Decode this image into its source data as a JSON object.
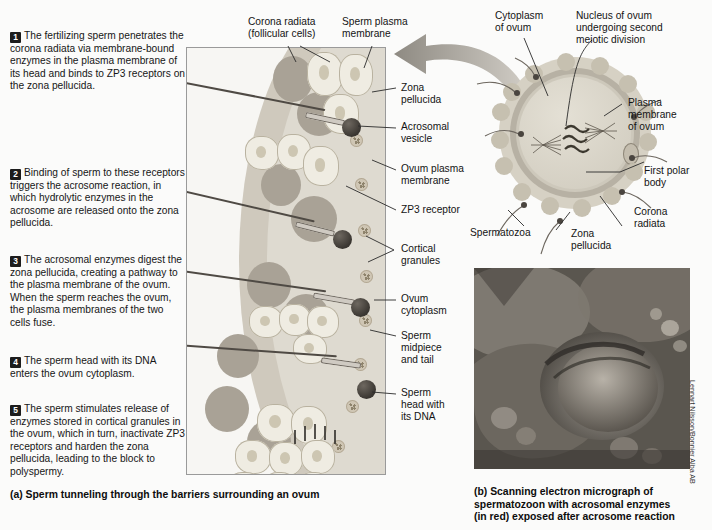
{
  "steps": [
    {
      "num": "1",
      "text": "The fertilizing sperm penetrates the corona radiata via membrane-bound enzymes in the plasma membrane of its head and binds to ZP3 receptors on the zona pellucida."
    },
    {
      "num": "2",
      "text": "Binding of sperm to these receptors triggers the acrosome reaction, in which hydrolytic enzymes in the acrosome are released onto the zona pellucida."
    },
    {
      "num": "3",
      "text": "The acrosomal enzymes digest the zona pellucida, creating a pathway to the plasma membrane of the ovum. When the sperm reaches the ovum, the plasma membranes of the two cells fuse."
    },
    {
      "num": "4",
      "text": "The sperm head with its DNA enters the ovum cytoplasm."
    },
    {
      "num": "5",
      "text": "The sperm stimulates release of enzymes stored in cortical granules in the ovum, which in turn, inactivate ZP3 receptors and harden the zona pellucida, leading to the block to polyspermy."
    }
  ],
  "panel_labels": {
    "corona_radiata": "Corona radiata\n(follicular cells)",
    "sperm_plasma_membrane": "Sperm plasma\nmembrane",
    "zona_pellucida": "Zona\npellucida",
    "acrosomal_vesicle": "Acrosomal\nvesicle",
    "ovum_plasma_membrane": "Ovum plasma\nmembrane",
    "zp3_receptor": "ZP3 receptor",
    "cortical_granules": "Cortical\ngranules",
    "ovum_cytoplasm": "Ovum\ncytoplasm",
    "sperm_midpiece_tail": "Sperm\nmidpiece\nand tail",
    "sperm_head_dna": "Sperm\nhead with\nits DNA"
  },
  "ovum_labels": {
    "cytoplasm_of_ovum": "Cytoplasm\nof ovum",
    "nucleus": "Nucleus of ovum\nundergoing second\nmeiotic division",
    "plasma_membrane_of_ovum": "Plasma\nmembrane\nof ovum",
    "first_polar_body": "First polar\nbody",
    "corona_radiata": "Corona\nradiata",
    "zona_pellucida": "Zona\npellucida",
    "spermatozoa": "Spermatozoa"
  },
  "captions": {
    "a": "(a)  Sperm tunneling through the barriers surrounding an ovum",
    "b": "(b)  Scanning electron micrograph of\nspermatozoon with acrosomal enzymes\n(in red) exposed after acrosome reaction"
  },
  "credit": "Lennart Nilsson/Bonnier Alba AB",
  "colors": {
    "text": "#141414",
    "badge_bg": "#1c1c1c",
    "zona_pellucida": "#b9b3a8",
    "ovum_cytoplasm": "#dedad0",
    "granulosa_cell": "#efece2",
    "sperm_head": "#3a3631",
    "panel_border": "#9a9a9a",
    "arrow": "#a8a39b"
  }
}
